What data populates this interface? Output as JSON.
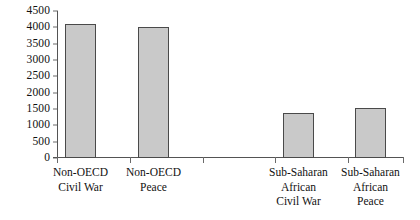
{
  "chart_data": {
    "type": "bar",
    "title": "",
    "subtitle": "",
    "xlabel": "",
    "ylabel": "",
    "categories": [
      "Non-OECD Civil War",
      "Non-OECD Peace",
      "Sub-Saharan African Civil War",
      "Sub-Saharan African Peace"
    ],
    "category_lines": [
      [
        "Non-OECD",
        "Civil War"
      ],
      [
        "Non-OECD",
        "Peace"
      ],
      [
        "Sub-Saharan",
        "African",
        "Civil War"
      ],
      [
        "Sub-Saharan",
        "African",
        "Peace"
      ]
    ],
    "values": [
      4100,
      4000,
      1380,
      1540
    ],
    "ylim": [
      0,
      4500
    ],
    "ytick_step": 500,
    "ytick_labels": [
      "4500",
      "4000",
      "3500",
      "3000",
      "2500",
      "2000",
      "1500",
      "1000",
      "500",
      "0"
    ],
    "ytick_values": [
      4500,
      4000,
      3500,
      3000,
      2500,
      2000,
      1500,
      1000,
      500,
      0
    ],
    "grid": false,
    "legend": null,
    "legend_position": "none",
    "bar_fill_color": "#c9c9c9",
    "bar_border_color": "#4a4a4a",
    "axis_color": "#545454",
    "text_color": "#111111",
    "background_color": "#ffffff"
  }
}
